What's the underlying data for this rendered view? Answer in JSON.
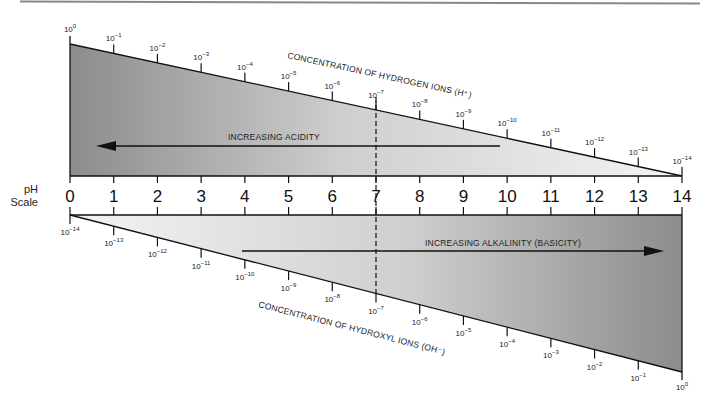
{
  "diagram": {
    "ph_label_line1": "pH",
    "ph_label_line2": "Scale",
    "ph_values": [
      "0",
      "1",
      "2",
      "3",
      "4",
      "5",
      "6",
      "7",
      "8",
      "9",
      "10",
      "11",
      "12",
      "13",
      "14"
    ],
    "hydrogen": {
      "caption": "CONCENTRATION OF HYDROGEN IONS (H⁺)",
      "exponents": [
        "0",
        "−1",
        "−2",
        "−3",
        "−4",
        "−5",
        "−6",
        "−7",
        "−8",
        "−9",
        "−10",
        "−11",
        "−12",
        "−13",
        "−14"
      ]
    },
    "hydroxyl": {
      "caption": "CONCENTRATION OF HYDROXYL IONS (OH⁻)",
      "exponents": [
        "−14",
        "−13",
        "−12",
        "−11",
        "−10",
        "−9",
        "−8",
        "−7",
        "−6",
        "−5",
        "−4",
        "−3",
        "−2",
        "−1",
        "0"
      ]
    },
    "acidity_label": "INCREASING ACIDITY",
    "alkalinity_label": "INCREASING ALKALINITY (BASICITY)",
    "neutral_ph": "7",
    "colors": {
      "dark_gray": "#8a8a8a",
      "light_gray": "#f2f2f2",
      "line": "#111111"
    }
  }
}
